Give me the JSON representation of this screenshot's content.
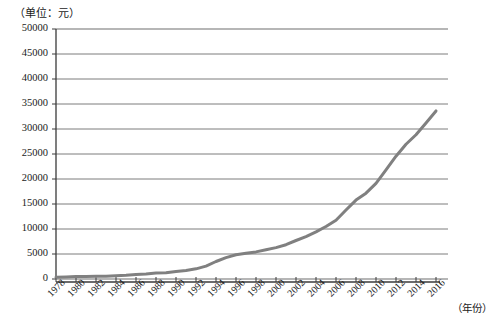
{
  "chart_data": {
    "type": "line",
    "title": "（单位：元）",
    "xlabel": "（年份）",
    "ylabel": "",
    "ylim": [
      0,
      50000
    ],
    "xlim": [
      1978,
      2016
    ],
    "grid": true,
    "legend": null,
    "y_ticks": [
      0,
      5000,
      10000,
      15000,
      20000,
      25000,
      30000,
      35000,
      40000,
      45000,
      50000
    ],
    "y_tick_labels": [
      "0",
      "5000",
      "10000",
      "15000",
      "20000",
      "25000",
      "30000",
      "35000",
      "40000",
      "45000",
      "50000"
    ],
    "x_ticks": [
      1978,
      1980,
      1982,
      1984,
      1986,
      1988,
      1990,
      1992,
      1994,
      1996,
      1998,
      2000,
      2002,
      2004,
      2006,
      2008,
      2010,
      2012,
      2014,
      2016
    ],
    "x_tick_labels": [
      "1978",
      "1980",
      "1982",
      "1984",
      "1986",
      "1988",
      "1990",
      "1992",
      "1994",
      "1996",
      "1998",
      "2000",
      "2002",
      "2004",
      "2006",
      "2008",
      "2010",
      "2012",
      "2014",
      "2016"
    ],
    "series": [
      {
        "name": "人均可支配收入",
        "color": "#808080",
        "x": [
          1978,
          1979,
          1980,
          1981,
          1982,
          1983,
          1984,
          1985,
          1986,
          1987,
          1988,
          1989,
          1990,
          1991,
          1992,
          1993,
          1994,
          1995,
          1996,
          1997,
          1998,
          1999,
          2000,
          2001,
          2002,
          2003,
          2004,
          2005,
          2006,
          2007,
          2008,
          2009,
          2010,
          2011,
          2012,
          2013,
          2014,
          2015,
          2016
        ],
        "values": [
          343,
          387,
          478,
          500,
          535,
          565,
          660,
          740,
          900,
          1000,
          1180,
          1260,
          1510,
          1700,
          2030,
          2580,
          3500,
          4280,
          4840,
          5160,
          5420,
          5850,
          6280,
          6860,
          7700,
          8470,
          9420,
          10490,
          11760,
          13790,
          15780,
          17170,
          19110,
          21810,
          24565,
          26955,
          28844,
          31195,
          33616
        ]
      }
    ]
  },
  "axis": {
    "unit_note": "（单位：元）",
    "year_note": "（年份）"
  }
}
